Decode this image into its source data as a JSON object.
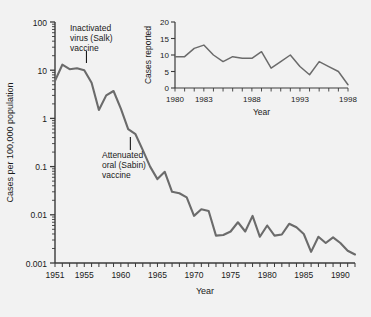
{
  "figure": {
    "background_color": "#f2f2f2",
    "line_color": "#6b6b6b",
    "axis_color": "#3a3a3a",
    "text_color": "#1a1a1a"
  },
  "annotations": [
    {
      "id": "salk",
      "lines": [
        "Inactivated",
        "virus (Salk)",
        "vaccine"
      ],
      "year": 1955.3,
      "leader": true
    },
    {
      "id": "sabin",
      "lines": [
        "Attenuated",
        "oral (Sabin)",
        "vaccine"
      ],
      "year": 1961.3,
      "leader": true
    }
  ],
  "chart_data": [
    {
      "id": "main",
      "type": "line",
      "title": "",
      "xlabel": "Year",
      "ylabel": "Cases per 100,000 population",
      "yscale": "log",
      "ylim": [
        0.001,
        100
      ],
      "xlim": [
        1951,
        1992
      ],
      "grid": false,
      "legend": "none",
      "ytick_labels": [
        "100",
        "10",
        "1",
        "0.1",
        "0.01",
        "0.001"
      ],
      "ytick_values": [
        100,
        10,
        1,
        0.1,
        0.01,
        0.001
      ],
      "xtick_labels": [
        "1951",
        "1955",
        "1960",
        "1965",
        "1970",
        "1975",
        "1980",
        "1985",
        "1990"
      ],
      "xtick_values": [
        1951,
        1955,
        1960,
        1965,
        1970,
        1975,
        1980,
        1985,
        1990
      ],
      "x": [
        1951,
        1952,
        1953,
        1954,
        1955,
        1956,
        1957,
        1958,
        1959,
        1960,
        1961,
        1962,
        1963,
        1964,
        1965,
        1966,
        1967,
        1968,
        1969,
        1970,
        1971,
        1972,
        1973,
        1974,
        1975,
        1976,
        1977,
        1978,
        1979,
        1980,
        1981,
        1982,
        1983,
        1984,
        1985,
        1986,
        1987,
        1988,
        1989,
        1990,
        1991,
        1992
      ],
      "y": [
        6.0,
        13.0,
        10.5,
        11.0,
        10.0,
        5.5,
        1.5,
        3.0,
        3.7,
        1.6,
        0.6,
        0.47,
        0.22,
        0.1,
        0.055,
        0.078,
        0.03,
        0.028,
        0.023,
        0.0095,
        0.013,
        0.012,
        0.0037,
        0.0038,
        0.0045,
        0.007,
        0.0045,
        0.0095,
        0.0035,
        0.006,
        0.0037,
        0.0039,
        0.0065,
        0.0055,
        0.004,
        0.0017,
        0.0035,
        0.0026,
        0.0034,
        0.0026,
        0.0018,
        0.0015
      ],
      "units": "cases per 100,000 population"
    },
    {
      "id": "inset",
      "type": "line",
      "title": "",
      "xlabel": "Year",
      "ylabel": "Cases reported",
      "yscale": "linear",
      "ylim": [
        0,
        20
      ],
      "xlim": [
        1980,
        1998
      ],
      "grid": false,
      "legend": "none",
      "ytick_labels": [
        "20",
        "15",
        "10",
        "5",
        "0"
      ],
      "ytick_values": [
        20,
        15,
        10,
        5,
        0
      ],
      "xtick_labels": [
        "1980",
        "1983",
        "1988",
        "1993",
        "1998"
      ],
      "xtick_values": [
        1980,
        1983,
        1988,
        1993,
        1998
      ],
      "x": [
        1980,
        1981,
        1982,
        1983,
        1984,
        1985,
        1986,
        1987,
        1988,
        1989,
        1990,
        1991,
        1992,
        1993,
        1994,
        1995,
        1996,
        1997,
        1998
      ],
      "y": [
        9.5,
        9.5,
        12.0,
        13.0,
        10.0,
        8.0,
        9.5,
        9.0,
        9.0,
        11.0,
        6.0,
        8.0,
        10.0,
        6.5,
        4.0,
        8.0,
        6.5,
        5.0,
        1.0
      ],
      "units": "cases reported"
    }
  ]
}
